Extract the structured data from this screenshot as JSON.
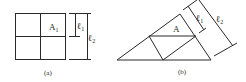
{
  "figure_a": {
    "caption": "(a)",
    "region_label": "A",
    "region_sub": "1",
    "dim_inner_label": "ℓ",
    "dim_inner_sub": "1",
    "dim_outer_label": "ℓ",
    "dim_outer_sub": "2"
  },
  "figure_b": {
    "caption": "(b)",
    "region_label": "A",
    "dim_inner_label": "ℓ",
    "dim_inner_sub": "1",
    "dim_outer_label": "ℓ",
    "dim_outer_sub": "2"
  },
  "colors": {
    "line": "#2a2a2a",
    "background": "#ffffff"
  }
}
